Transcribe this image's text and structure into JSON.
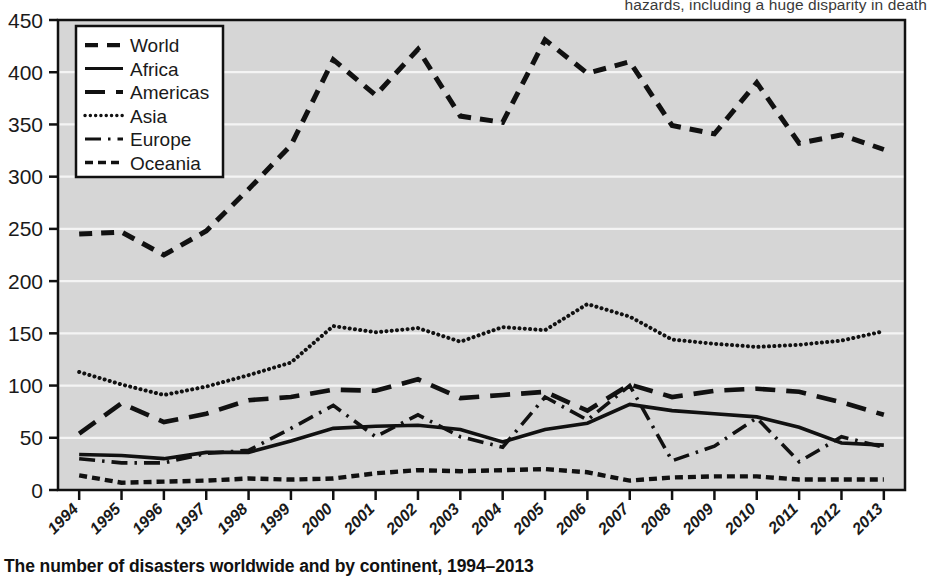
{
  "top_text": "hazards, including a huge disparity in death",
  "caption": "The number of disasters worldwide and by continent, 1994–2013",
  "colors": {
    "line": "#111111",
    "plot_background": "#d6d6d6",
    "gridline": "#f4f4f4",
    "axis": "#111111",
    "legend_background": "#ffffff",
    "text": "#1a1a1a"
  },
  "chart_data": {
    "type": "line",
    "title": "The number of disasters worldwide and by continent, 1994–2013",
    "xlabel": "",
    "ylabel": "",
    "ylim": [
      0,
      450
    ],
    "yticks": [
      0,
      50,
      100,
      150,
      200,
      250,
      300,
      350,
      400,
      450
    ],
    "grid": true,
    "legend_position": "top-left",
    "categories": [
      "1994",
      "1995",
      "1996",
      "1997",
      "1998",
      "1999",
      "2000",
      "2001",
      "2002",
      "2003",
      "2004",
      "2005",
      "2006",
      "2007",
      "2008",
      "2009",
      "2010",
      "2011",
      "2012",
      "2013"
    ],
    "x": [
      1994,
      1995,
      1996,
      1997,
      1998,
      1999,
      2000,
      2001,
      2002,
      2003,
      2004,
      2005,
      2006,
      2007,
      2008,
      2009,
      2010,
      2011,
      2012,
      2013
    ],
    "series": [
      {
        "name": "World",
        "dash": "World",
        "values": [
          245,
          247,
          225,
          248,
          288,
          330,
          412,
          378,
          422,
          358,
          352,
          431,
          399,
          410,
          349,
          341,
          390,
          332,
          340,
          326
        ]
      },
      {
        "name": "Africa",
        "dash": "Africa",
        "values": [
          34,
          33,
          30,
          36,
          36,
          47,
          59,
          61,
          62,
          58,
          46,
          58,
          64,
          82,
          76,
          73,
          70,
          60,
          45,
          43
        ]
      },
      {
        "name": "Americas",
        "dash": "Americas",
        "values": [
          54,
          83,
          65,
          73,
          86,
          89,
          96,
          95,
          106,
          88,
          91,
          94,
          76,
          101,
          89,
          95,
          97,
          94,
          84,
          72
        ]
      },
      {
        "name": "Asia",
        "dash": "Asia",
        "values": [
          113,
          101,
          91,
          99,
          110,
          122,
          157,
          151,
          155,
          142,
          156,
          153,
          178,
          166,
          144,
          140,
          137,
          139,
          143,
          152
        ]
      },
      {
        "name": "Europe",
        "dash": "Europe",
        "values": [
          30,
          26,
          26,
          35,
          38,
          59,
          81,
          51,
          72,
          51,
          41,
          89,
          67,
          100,
          28,
          42,
          69,
          27,
          51,
          41
        ]
      },
      {
        "name": "Oceania",
        "dash": "Oceania",
        "values": [
          14,
          7,
          8,
          9,
          11,
          10,
          11,
          16,
          19,
          18,
          19,
          20,
          17,
          9,
          12,
          13,
          13,
          10,
          10,
          10
        ]
      }
    ]
  }
}
